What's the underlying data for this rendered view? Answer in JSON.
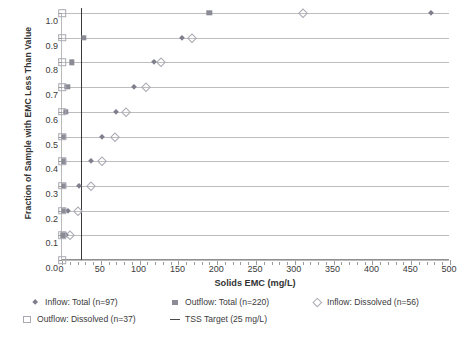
{
  "chart_data": {
    "type": "scatter",
    "title": "",
    "xlabel": "Solids EMC (mg/L)",
    "ylabel": "Fraction of Sample with EMC Less Than Value",
    "xlim": [
      0,
      500
    ],
    "ylim": [
      0,
      1.0
    ],
    "xticks": [
      0,
      50,
      100,
      150,
      200,
      250,
      300,
      350,
      400,
      450,
      500
    ],
    "xtick_labels": [
      "0",
      "50",
      "100",
      "150",
      "200",
      "250",
      "300",
      "350",
      "400",
      "450",
      "500"
    ],
    "xminor_step": 10,
    "yticks": [
      0.0,
      0.1,
      0.2,
      0.3,
      0.4,
      0.5,
      0.6,
      0.7,
      0.8,
      0.9,
      1.0
    ],
    "ytick_labels": [
      "0.0",
      "0.1",
      "0.2",
      "0.3",
      "0.4",
      "0.5",
      "0.6",
      "0.7",
      "0.8",
      "0.9",
      "1.0"
    ],
    "grid": "horizontal",
    "legend_position": "below",
    "series": [
      {
        "name": "Inflow: Total (n=97)",
        "marker": "diamond-filled",
        "color": "#7e7e8c",
        "points": [
          {
            "x": 5,
            "y": 0.1
          },
          {
            "x": 8,
            "y": 0.2
          },
          {
            "x": 22,
            "y": 0.3
          },
          {
            "x": 38,
            "y": 0.4
          },
          {
            "x": 52,
            "y": 0.5
          },
          {
            "x": 70,
            "y": 0.6
          },
          {
            "x": 93,
            "y": 0.7
          },
          {
            "x": 118,
            "y": 0.8
          },
          {
            "x": 155,
            "y": 0.9
          },
          {
            "x": 475,
            "y": 1.0
          }
        ]
      },
      {
        "name": "Outflow: Total (n=220)",
        "marker": "square-filled",
        "color": "#8b8b96",
        "points": [
          {
            "x": 1,
            "y": 0.1
          },
          {
            "x": 2,
            "y": 0.2
          },
          {
            "x": 2,
            "y": 0.3
          },
          {
            "x": 2,
            "y": 0.4
          },
          {
            "x": 2,
            "y": 0.5
          },
          {
            "x": 5,
            "y": 0.6
          },
          {
            "x": 7,
            "y": 0.7
          },
          {
            "x": 13,
            "y": 0.8
          },
          {
            "x": 28,
            "y": 0.9
          },
          {
            "x": 190,
            "y": 1.0
          }
        ]
      },
      {
        "name": "Inflow: Dissolved (n=56)",
        "marker": "diamond-open",
        "color": "#a9a9b4",
        "points": [
          {
            "x": 10,
            "y": 0.1
          },
          {
            "x": 20,
            "y": 0.2
          },
          {
            "x": 37,
            "y": 0.3
          },
          {
            "x": 52,
            "y": 0.4
          },
          {
            "x": 68,
            "y": 0.5
          },
          {
            "x": 82,
            "y": 0.6
          },
          {
            "x": 108,
            "y": 0.7
          },
          {
            "x": 128,
            "y": 0.8
          },
          {
            "x": 168,
            "y": 0.9
          },
          {
            "x": 310,
            "y": 1.0
          }
        ]
      },
      {
        "name": "Outflow: Dissolved (n=37)",
        "marker": "square-open",
        "color": "#a9a9b4",
        "points": [
          {
            "x": 0,
            "y": 0.0
          },
          {
            "x": 0,
            "y": 0.1
          },
          {
            "x": 0,
            "y": 0.2
          },
          {
            "x": 0,
            "y": 0.3
          },
          {
            "x": 0,
            "y": 0.4
          },
          {
            "x": 0,
            "y": 0.5
          },
          {
            "x": 0,
            "y": 0.6
          },
          {
            "x": 0,
            "y": 0.7
          },
          {
            "x": 0,
            "y": 0.8
          },
          {
            "x": 0,
            "y": 0.9
          },
          {
            "x": 0,
            "y": 1.0
          }
        ]
      }
    ],
    "reference_lines": [
      {
        "name": "TSS Target (25 mg/L)",
        "orientation": "vertical",
        "value": 25,
        "color": "#3a3a3a"
      }
    ]
  },
  "legend": {
    "items": [
      {
        "label": "Inflow: Total (n=97)",
        "marker": "diamond-filled"
      },
      {
        "label": "Outflow: Total (n=220)",
        "marker": "square-filled"
      },
      {
        "label": "Inflow: Dissolved (n=56)",
        "marker": "diamond-open"
      },
      {
        "label": "Outflow: Dissolved (n=37)",
        "marker": "square-open"
      },
      {
        "label": "TSS Target (25 mg/L)",
        "marker": "line"
      }
    ]
  }
}
